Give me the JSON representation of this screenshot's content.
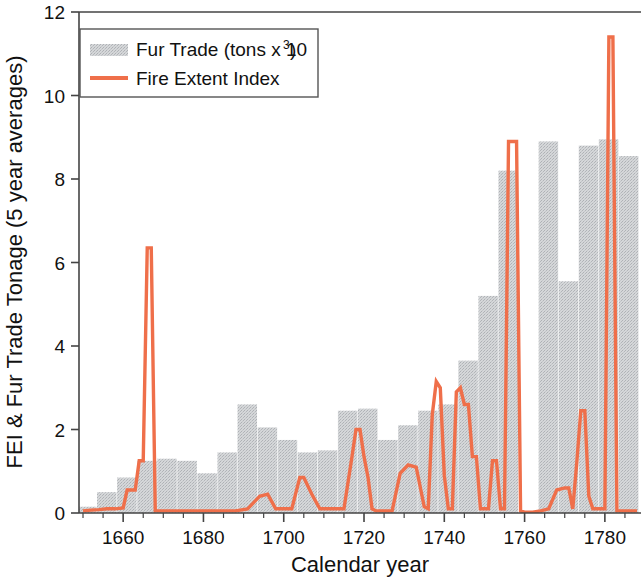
{
  "chart_data": {
    "type": "bar",
    "title": "",
    "xlabel": "Calendar year",
    "ylabel": "FEI & Fur Trade Tonage (5 year averages)",
    "xlim": [
      1649,
      1789
    ],
    "ylim": [
      0,
      12
    ],
    "xticks": [
      1660,
      1680,
      1700,
      1720,
      1740,
      1760,
      1780
    ],
    "xtick_labels": [
      "1660",
      "1680",
      "1700",
      "1720",
      "1740",
      "1760",
      "1780"
    ],
    "xtick_minor_step": 5,
    "yticks": [
      0,
      2,
      4,
      6,
      8,
      10,
      12
    ],
    "ytick_labels": [
      "0",
      "2",
      "4",
      "6",
      "8",
      "10",
      "12"
    ],
    "grid": false,
    "legend_position": "upper-left",
    "colors": {
      "bar_fill": "#d0d2d4",
      "bar_texture": "#b9bcc0",
      "line": "#ef6f4a",
      "axis": "#444444",
      "text": "#111111",
      "background": "#ffffff"
    },
    "bar_width_years": 5,
    "series": [
      {
        "name": "Fur Trade (tons x 10^3)",
        "label": "Fur Trade (tons x 10",
        "label_sup": "3",
        "label_tail": ")",
        "type": "bar",
        "x": [
          1651,
          1656,
          1661,
          1666,
          1671,
          1676,
          1681,
          1686,
          1691,
          1696,
          1701,
          1706,
          1711,
          1716,
          1721,
          1726,
          1731,
          1736,
          1741,
          1746,
          1751,
          1756,
          1761,
          1766,
          1771,
          1776,
          1781,
          1786
        ],
        "values": [
          0.15,
          0.5,
          0.85,
          1.25,
          1.3,
          1.25,
          0.95,
          1.45,
          2.6,
          2.05,
          1.75,
          1.45,
          1.5,
          2.45,
          2.5,
          1.75,
          2.1,
          2.45,
          2.6,
          3.65,
          5.2,
          8.2,
          0.0,
          8.9,
          5.55,
          8.8,
          8.95,
          8.55
        ]
      },
      {
        "name": "Fire Extent Index",
        "label": "Fire Extent Index",
        "type": "line",
        "x": [
          1650,
          1652,
          1654,
          1656,
          1658,
          1660,
          1661,
          1663,
          1664,
          1665,
          1666,
          1667,
          1668,
          1669,
          1670,
          1673,
          1676,
          1679,
          1682,
          1685,
          1688,
          1691,
          1694,
          1696,
          1698,
          1700,
          1702,
          1704,
          1705,
          1707,
          1709,
          1711,
          1713,
          1715,
          1717,
          1718,
          1719,
          1720,
          1721,
          1722,
          1723,
          1725,
          1727,
          1729,
          1731,
          1733,
          1735,
          1736,
          1737,
          1738,
          1739,
          1740,
          1741,
          1742,
          1743,
          1744,
          1745,
          1746,
          1747,
          1748,
          1749,
          1750,
          1751,
          1752,
          1753,
          1754,
          1755,
          1756,
          1757,
          1758,
          1759,
          1760,
          1762,
          1764,
          1766,
          1768,
          1770,
          1771,
          1772,
          1773,
          1774,
          1775,
          1776,
          1777,
          1778,
          1779,
          1780,
          1781,
          1782,
          1783,
          1784,
          1786,
          1788
        ],
        "values": [
          0.05,
          0.07,
          0.08,
          0.1,
          0.1,
          0.12,
          0.55,
          0.55,
          1.25,
          1.25,
          6.35,
          6.35,
          0.05,
          0.05,
          0.05,
          0.05,
          0.05,
          0.05,
          0.05,
          0.05,
          0.05,
          0.1,
          0.4,
          0.45,
          0.1,
          0.1,
          0.1,
          0.85,
          0.85,
          0.45,
          0.1,
          0.1,
          0.1,
          0.1,
          1.35,
          2.0,
          2.0,
          1.35,
          0.85,
          0.1,
          0.05,
          0.05,
          0.05,
          0.95,
          1.15,
          1.1,
          0.15,
          0.1,
          2.35,
          3.15,
          3.0,
          0.9,
          0.1,
          0.1,
          2.9,
          3.0,
          2.6,
          2.6,
          1.35,
          1.35,
          0.1,
          0.1,
          0.1,
          1.25,
          1.25,
          0.1,
          0.1,
          8.9,
          8.9,
          8.9,
          0.05,
          0.02,
          0.02,
          0.05,
          0.1,
          0.55,
          0.6,
          0.6,
          0.1,
          1.2,
          2.45,
          2.45,
          0.4,
          0.1,
          0.1,
          0.1,
          0.1,
          11.4,
          11.4,
          0.05,
          0.05,
          0.05,
          0.05
        ]
      }
    ]
  },
  "legend": {
    "items": [
      {
        "label": "Fur Trade (tons x 10",
        "sup": "3",
        "tail": ")",
        "swatch": "bar"
      },
      {
        "label": "Fire Extent Index",
        "sup": "",
        "tail": "",
        "swatch": "line"
      }
    ]
  },
  "axes": {
    "x_title": "Calendar year",
    "y_title": "FEI & Fur Trade Tonage (5 year averages)"
  }
}
